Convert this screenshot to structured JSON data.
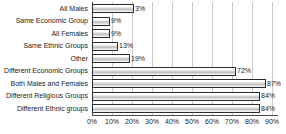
{
  "chart_data": {
    "type": "bar",
    "orientation": "horizontal",
    "title": "",
    "xlabel": "",
    "ylabel": "",
    "xlim": [
      0,
      93
    ],
    "grid": true,
    "legend": "none",
    "xticks": [
      "0%",
      "10%",
      "20%",
      "30%",
      "40%",
      "50%",
      "60%",
      "70%",
      "80%",
      "90%"
    ],
    "xtick_values": [
      0,
      10,
      20,
      30,
      40,
      50,
      60,
      70,
      80,
      90
    ],
    "categories": [
      "All Males",
      "Same Economic Group",
      "All Females",
      "Same Ethnic Groups",
      "Other",
      "Different Economic Groups",
      "Both Males and Females",
      "Different Religious Groups",
      "Different Ethnic groups"
    ],
    "values": [
      3,
      9,
      9,
      13,
      19,
      72,
      87,
      84,
      84
    ],
    "bar_lengths": [
      21,
      9,
      9,
      13,
      19,
      72,
      87,
      84,
      84
    ],
    "data_labels": [
      "3%",
      "9%",
      "9%",
      "13%",
      "19%",
      "72%",
      "87%",
      "84%",
      "84%"
    ],
    "colors": {
      "bar_fill": "#d9d9d9",
      "bar_border": "#2b2b2b",
      "gridline": "#c9c9c9",
      "axis": "#4a4a4a",
      "text": "#1a1a1a",
      "background": "#ffffff"
    }
  }
}
